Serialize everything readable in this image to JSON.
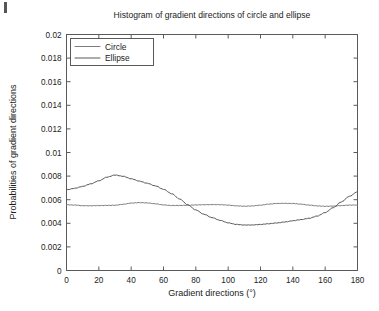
{
  "figure": {
    "background": "#ffffff",
    "corner_mark": "page-edge-mark"
  },
  "chart_data": {
    "type": "line",
    "title": "Histogram of gradient directions of circle and ellipse",
    "xlabel": "Gradient directions (°)",
    "ylabel": "Probabilities of gradient directions",
    "xlim": [
      0,
      180
    ],
    "ylim": [
      0,
      0.02
    ],
    "xticks": [
      0,
      20,
      40,
      60,
      80,
      100,
      120,
      140,
      160,
      180
    ],
    "xtick_labels": [
      "0",
      "20",
      "40",
      "60",
      "80",
      "100",
      "120",
      "140",
      "160",
      "180"
    ],
    "yticks": [
      0,
      0.002,
      0.004,
      0.006,
      0.008,
      0.01,
      0.012,
      0.014,
      0.016,
      0.018,
      0.02
    ],
    "ytick_labels": [
      "0",
      "0.002",
      "0.004",
      "0.006",
      "0.008",
      "0.01",
      "0.012",
      "0.014",
      "0.016",
      "0.018",
      "0.02"
    ],
    "grid": false,
    "legend_position": "upper-left",
    "x": [
      0,
      5,
      10,
      15,
      20,
      25,
      30,
      35,
      40,
      45,
      50,
      55,
      60,
      65,
      70,
      75,
      80,
      85,
      90,
      95,
      100,
      105,
      110,
      115,
      120,
      125,
      130,
      135,
      140,
      145,
      150,
      155,
      160,
      165,
      170,
      175,
      180
    ],
    "series": [
      {
        "name": "Circle",
        "color": "#7d7d7d",
        "values": [
          0.00557,
          0.00556,
          0.0055,
          0.00548,
          0.00549,
          0.00551,
          0.00554,
          0.00562,
          0.00571,
          0.00574,
          0.00572,
          0.00566,
          0.00557,
          0.00551,
          0.0055,
          0.00551,
          0.00556,
          0.00559,
          0.00559,
          0.00557,
          0.00553,
          0.00548,
          0.00546,
          0.00548,
          0.00553,
          0.00561,
          0.00568,
          0.0057,
          0.00569,
          0.00562,
          0.00553,
          0.00547,
          0.00545,
          0.00547,
          0.0055,
          0.00553,
          0.00554
        ]
      },
      {
        "name": "Ellipse",
        "color": "#585858",
        "values": [
          0.00685,
          0.00697,
          0.00712,
          0.00733,
          0.0076,
          0.00792,
          0.0081,
          0.00798,
          0.00776,
          0.00757,
          0.0074,
          0.00718,
          0.00688,
          0.0065,
          0.00605,
          0.00558,
          0.00514,
          0.00477,
          0.00447,
          0.00424,
          0.00404,
          0.00392,
          0.00386,
          0.00385,
          0.00389,
          0.00396,
          0.00404,
          0.00412,
          0.00421,
          0.0043,
          0.00442,
          0.00462,
          0.00492,
          0.00533,
          0.0058,
          0.00628,
          0.00668
        ]
      }
    ]
  }
}
